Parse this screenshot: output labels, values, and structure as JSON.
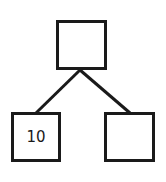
{
  "diagram": {
    "type": "tree",
    "colors": {
      "stroke": "#1a1a1a",
      "fill": "#ffffff"
    },
    "nodes": {
      "root": {
        "label": ""
      },
      "left": {
        "label": "10"
      },
      "right": {
        "label": ""
      }
    },
    "edges": [
      {
        "from": "root",
        "to": "left"
      },
      {
        "from": "root",
        "to": "right"
      }
    ]
  }
}
